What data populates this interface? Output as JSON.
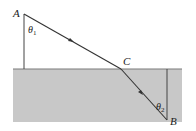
{
  "diagram": {
    "type": "refraction",
    "points": {
      "A": {
        "label": "A",
        "x": 24,
        "y": 13
      },
      "C": {
        "label": "C",
        "x": 121,
        "y": 69
      },
      "B": {
        "label": "B",
        "x": 167,
        "y": 120
      }
    },
    "angles": {
      "theta1": {
        "label": "θ",
        "sub": "1"
      },
      "theta2": {
        "label": "θ",
        "sub": "2"
      }
    },
    "colors": {
      "medium": "#c4c4c4",
      "line": "#333333",
      "surface": "#777777"
    }
  }
}
